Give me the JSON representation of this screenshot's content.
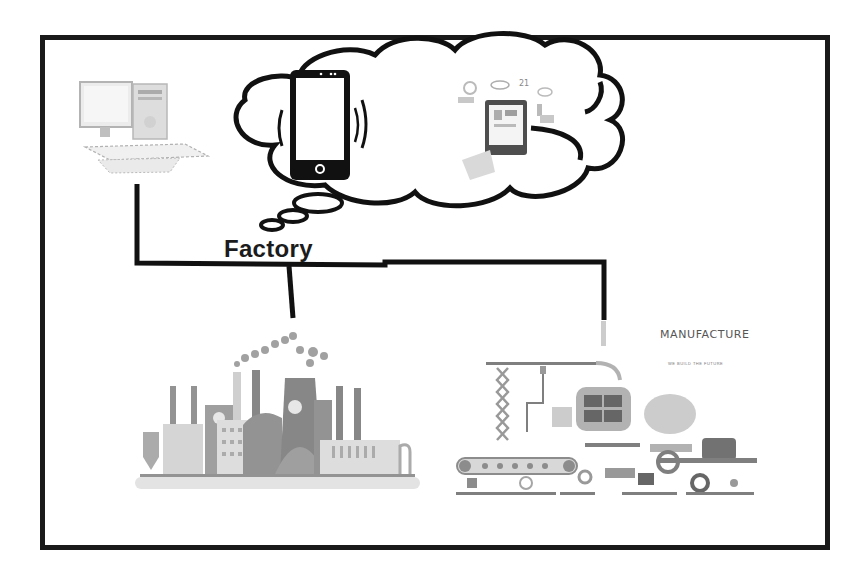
{
  "diagram": {
    "labels": {
      "factory": "Factory",
      "manufacture_title": "MANUFACTURE",
      "manufacture_subtitle": "WE BUILD THE FUTURE",
      "cloud_annotation_number": "21"
    },
    "nodes": [
      {
        "id": "computer",
        "type": "desktop-computer",
        "position": "top-left"
      },
      {
        "id": "thought-cloud",
        "type": "cloud",
        "contains": [
          "smartphone-vibrating",
          "smartphone-with-app-icons"
        ]
      },
      {
        "id": "factory-illustration",
        "type": "factory-buildings",
        "position": "bottom-left"
      },
      {
        "id": "manufacture-illustration",
        "type": "assembly-line-machinery",
        "position": "bottom-right"
      }
    ],
    "edges": [
      {
        "from": "computer",
        "to": "factory-illustration"
      },
      {
        "from": "computer",
        "to": "manufacture-illustration"
      }
    ],
    "colors": {
      "line": "#111111",
      "frame": "#1a1a1a",
      "illustration_gray": "#8a8a8a",
      "light_gray": "#cfcfcf"
    }
  }
}
